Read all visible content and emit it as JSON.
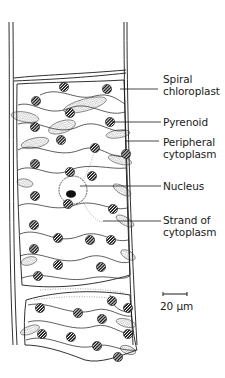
{
  "figure": {
    "type": "biological-diagram",
    "colors": {
      "ink": "#1a1a1a",
      "background": "#ffffff",
      "stipple": "#555555"
    }
  },
  "labels": [
    {
      "id": "spiral-chloroplast",
      "text": "Spiral\nchloroplast",
      "x": 163,
      "y": 73,
      "line_from": [
        120,
        89
      ],
      "line_to": [
        158,
        89
      ]
    },
    {
      "id": "pyrenoid",
      "text": "Pyrenoid",
      "x": 163,
      "y": 116,
      "line_from": [
        112,
        122
      ],
      "line_to": [
        161,
        122
      ]
    },
    {
      "id": "peripheral-cytoplasm",
      "text": "Peripheral\ncytoplasm",
      "x": 163,
      "y": 136,
      "line_from": [
        125,
        141
      ],
      "line_to": [
        159,
        141
      ]
    },
    {
      "id": "nucleus",
      "text": "Nucleus",
      "x": 163,
      "y": 180,
      "line_from": [
        80,
        186
      ],
      "line_to": [
        161,
        186
      ]
    },
    {
      "id": "strand-of-cytoplasm",
      "text": "Strand of\ncytoplasm",
      "x": 163,
      "y": 214,
      "line_from": [
        103,
        221
      ],
      "line_to": [
        161,
        221
      ]
    }
  ],
  "scale_bar": {
    "label": "20 μm",
    "x1": 163,
    "x2": 187,
    "y": 294,
    "text_x": 160,
    "text_y": 300
  },
  "pyrenoids": [
    [
      64,
      87
    ],
    [
      107,
      89
    ],
    [
      36,
      101
    ],
    [
      70,
      113
    ],
    [
      110,
      122
    ],
    [
      35,
      127
    ],
    [
      61,
      140
    ],
    [
      95,
      148
    ],
    [
      126,
      154
    ],
    [
      35,
      164
    ],
    [
      70,
      172
    ],
    [
      92,
      176
    ],
    [
      35,
      196
    ],
    [
      68,
      204
    ],
    [
      113,
      209
    ],
    [
      34,
      225
    ],
    [
      58,
      238
    ],
    [
      90,
      240
    ],
    [
      111,
      240
    ],
    [
      34,
      249
    ],
    [
      58,
      265
    ],
    [
      101,
      267
    ],
    [
      38,
      276
    ],
    [
      112,
      301
    ],
    [
      40,
      308
    ],
    [
      78,
      313
    ],
    [
      102,
      319
    ],
    [
      128,
      308
    ],
    [
      42,
      334
    ],
    [
      71,
      337
    ],
    [
      128,
      334
    ],
    [
      97,
      346
    ],
    [
      118,
      357
    ]
  ],
  "stipple_patches": [
    [
      85,
      105,
      22,
      6,
      -15
    ],
    [
      25,
      117,
      14,
      5,
      10
    ],
    [
      62,
      127,
      14,
      6,
      -18
    ],
    [
      118,
      134,
      12,
      4,
      -8
    ],
    [
      35,
      143,
      14,
      5,
      -12
    ],
    [
      120,
      160,
      12,
      4,
      15
    ],
    [
      25,
      183,
      8,
      4,
      10
    ],
    [
      122,
      190,
      10,
      4,
      30
    ],
    [
      125,
      221,
      10,
      4,
      30
    ],
    [
      128,
      255,
      8,
      4,
      30
    ],
    [
      29,
      261,
      8,
      4,
      -15
    ],
    [
      30,
      330,
      10,
      4,
      -20
    ],
    [
      126,
      323,
      10,
      4,
      15
    ],
    [
      128,
      350,
      8,
      4,
      20
    ]
  ]
}
